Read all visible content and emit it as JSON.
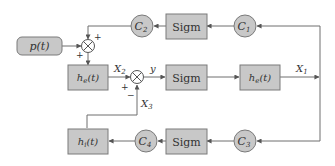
{
  "diagram": {
    "type": "block-diagram",
    "colors": {
      "block_fill": "#c8c8c8",
      "block_stroke": "#7a7a7a",
      "line": "#6e6e6e",
      "text": "#333333",
      "background": "#ffffff"
    },
    "blocks": {
      "sigm_top": "Sigm",
      "sigm_mid": "Sigm",
      "sigm_bot": "Sigm",
      "he_left": {
        "base": "h",
        "sub": "e",
        "arg": "(t)"
      },
      "he_right": {
        "base": "h",
        "sub": "e",
        "arg": "(t)"
      },
      "hi_bottom": {
        "base": "h",
        "sub": "i",
        "arg": "(t)"
      },
      "input": {
        "base": "p",
        "arg": "(t)"
      }
    },
    "gains": {
      "c1": {
        "base": "C",
        "sub": "1"
      },
      "c2": {
        "base": "C",
        "sub": "2"
      },
      "c3": {
        "base": "C",
        "sub": "3"
      },
      "c4": {
        "base": "C",
        "sub": "4"
      }
    },
    "signals": {
      "x1": {
        "base": "X",
        "sub": "1"
      },
      "x2": {
        "base": "X",
        "sub": "2"
      },
      "x3": {
        "base": "X",
        "sub": "3"
      },
      "y": "y"
    },
    "junction_signs": {
      "sum1_top": "+",
      "sum1_left": "+",
      "sum2_left": "+",
      "sum2_bottom": "−"
    }
  }
}
